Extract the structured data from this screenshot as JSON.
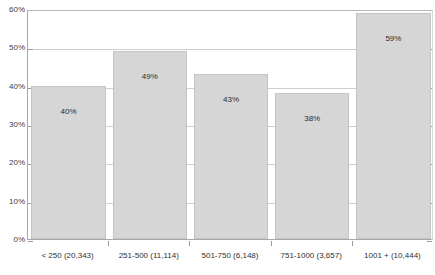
{
  "chart_data": {
    "type": "bar",
    "title": "",
    "subtitle": "",
    "xlabel": "",
    "ylabel": "",
    "categories": [
      "< 250 (20,343)",
      "251-500 (11,114)",
      "501-750 (6,148)",
      "751-1000 (3,657)",
      "1001 + (10,444)"
    ],
    "values": [
      40,
      49,
      43,
      38,
      59
    ],
    "data_labels": [
      "40%",
      "49%",
      "43%",
      "38%",
      "59%"
    ],
    "ylim": [
      0,
      60
    ],
    "ytick_values": [
      0,
      10,
      20,
      30,
      40,
      50,
      60
    ],
    "ytick_labels": [
      "0%",
      "10%",
      "20%",
      "30%",
      "40%",
      "50%",
      "60%"
    ],
    "grid": true,
    "legend": false,
    "legend_position": "none",
    "bar_color": "#d6d6d6",
    "bar_border_color": "#c4c4c4",
    "gridline_color": "#cfcfcf",
    "axis_color": "#a8a8a8",
    "background_color": "#ffffff",
    "text_color": "#303030"
  }
}
